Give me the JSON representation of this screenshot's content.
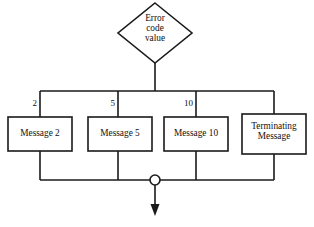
{
  "diagram": {
    "type": "flowchart",
    "background_color": "#ffffff",
    "line_color": "#1a1a1a",
    "decision": {
      "shape": "diamond",
      "label": "Error\ncode\nvalue",
      "line1": "Error",
      "line2": "code",
      "line3": "value"
    },
    "branches": [
      {
        "label": "2",
        "node_label": "Message 2",
        "shape": "rectangle"
      },
      {
        "label": "5",
        "node_label": "Message 5",
        "shape": "rectangle"
      },
      {
        "label": "10",
        "node_label": "Message 10",
        "shape": "rectangle"
      },
      {
        "label": "",
        "node_label": "Terminating\nMessage",
        "shape": "rectangle"
      }
    ],
    "merge": {
      "junction_shape": "circle",
      "outflow": "arrow-down"
    }
  }
}
